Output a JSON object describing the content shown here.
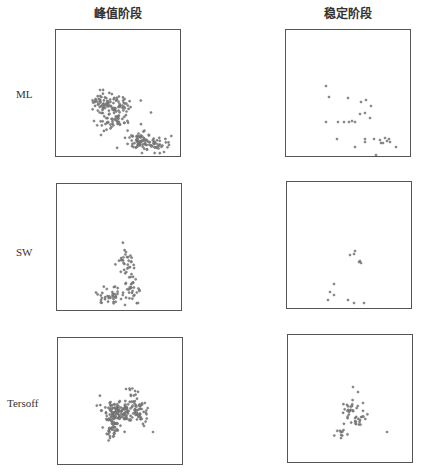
{
  "column_titles": [
    "峰值阶段",
    "稳定阶段"
  ],
  "row_labels": [
    "ML",
    "SW",
    "Tersoff"
  ],
  "colors": {
    "marker_fill": "#8a8a8a",
    "marker_stroke": "#5c5c5c",
    "frame": "#555555"
  },
  "chart_data": {
    "type": "scatter",
    "title": "",
    "layout": "3x2 grid of scatter panels, no axes/ticks, framed boxes",
    "columns": [
      "峰值阶段",
      "稳定阶段"
    ],
    "rows": [
      "ML",
      "SW",
      "Tersoff"
    ],
    "grid": false,
    "legend": "none",
    "panels": [
      {
        "row": "ML",
        "column": "峰值阶段",
        "box": [
          55,
          29,
          126,
          128
        ],
        "density": "dense",
        "clusters": [
          {
            "cx": 105,
            "cy": 103,
            "sx": 6,
            "sy": 5,
            "n": 55
          },
          {
            "cx": 119,
            "cy": 104,
            "sx": 5,
            "sy": 5,
            "n": 30
          },
          {
            "cx": 111,
            "cy": 120,
            "sx": 6,
            "sy": 5,
            "n": 40
          },
          {
            "cx": 138,
            "cy": 142,
            "sx": 6,
            "sy": 5,
            "n": 55
          },
          {
            "cx": 155,
            "cy": 144,
            "sx": 6,
            "sy": 4,
            "n": 40
          },
          {
            "cx": 126,
            "cy": 115,
            "sx": 9,
            "sy": 9,
            "n": 18
          }
        ],
        "extra_points": [
          [
            100,
            90
          ],
          [
            96,
            100
          ],
          [
            94,
            121
          ],
          [
            101,
            135
          ],
          [
            164,
            152
          ],
          [
            142,
            153
          ],
          [
            169,
            145
          ]
        ]
      },
      {
        "row": "ML",
        "column": "稳定阶段",
        "box": [
          285,
          29,
          126,
          128
        ],
        "density": "sparse",
        "points": [
          [
            326,
            86
          ],
          [
            329,
            97
          ],
          [
            348,
            98
          ],
          [
            361,
            102
          ],
          [
            366,
            100
          ],
          [
            371,
            106
          ],
          [
            360,
            114
          ],
          [
            365,
            113
          ],
          [
            370,
            118
          ],
          [
            326,
            122
          ],
          [
            338,
            122
          ],
          [
            344,
            122
          ],
          [
            349,
            122
          ],
          [
            352,
            121
          ],
          [
            355,
            122
          ],
          [
            337,
            139
          ],
          [
            365,
            139
          ],
          [
            365,
            142
          ],
          [
            374,
            139
          ],
          [
            380,
            140
          ],
          [
            381,
            143
          ],
          [
            385,
            138
          ],
          [
            389,
            139
          ],
          [
            390,
            142
          ],
          [
            387,
            141
          ],
          [
            383,
            143
          ],
          [
            355,
            147
          ],
          [
            376,
            155
          ],
          [
            396,
            147
          ]
        ]
      },
      {
        "row": "SW",
        "column": "峰值阶段",
        "box": [
          56,
          183,
          126,
          128
        ],
        "density": "medium",
        "clusters": [
          {
            "cx": 127,
            "cy": 263,
            "sx": 4,
            "sy": 6,
            "n": 30
          },
          {
            "cx": 133,
            "cy": 290,
            "sx": 4,
            "sy": 6,
            "n": 28
          },
          {
            "cx": 112,
            "cy": 294,
            "sx": 6,
            "sy": 4,
            "n": 30
          },
          {
            "cx": 102,
            "cy": 298,
            "sx": 3,
            "sy": 3,
            "n": 8
          }
        ],
        "extra_points": [
          [
            126,
            252
          ],
          [
            126,
            283
          ],
          [
            121,
            299
          ],
          [
            125,
            305
          ],
          [
            138,
            303
          ]
        ]
      },
      {
        "row": "SW",
        "column": "稳定阶段",
        "box": [
          286,
          181,
          126,
          128
        ],
        "density": "sparse",
        "points": [
          [
            350,
            255
          ],
          [
            354,
            254
          ],
          [
            355,
            251
          ],
          [
            360,
            261
          ],
          [
            361,
            263
          ],
          [
            359,
            262
          ],
          [
            334,
            284
          ],
          [
            330,
            292
          ],
          [
            334,
            295
          ],
          [
            328,
            300
          ],
          [
            348,
            300
          ],
          [
            354,
            303
          ],
          [
            364,
            303
          ]
        ]
      },
      {
        "row": "Tersoff",
        "column": "峰值阶段",
        "box": [
          57,
          337,
          126,
          128
        ],
        "density": "very dense",
        "clusters": [
          {
            "cx": 118,
            "cy": 411,
            "sx": 8,
            "sy": 6,
            "n": 120
          },
          {
            "cx": 140,
            "cy": 412,
            "sx": 5,
            "sy": 5,
            "n": 50
          },
          {
            "cx": 112,
            "cy": 427,
            "sx": 4,
            "sy": 6,
            "n": 45
          },
          {
            "cx": 133,
            "cy": 397,
            "sx": 3,
            "sy": 5,
            "n": 12
          }
        ],
        "extra_points": [
          [
            126,
            389
          ],
          [
            130,
            390
          ],
          [
            144,
            426
          ],
          [
            153,
            432
          ],
          [
            110,
            438
          ]
        ]
      },
      {
        "row": "Tersoff",
        "column": "稳定阶段",
        "box": [
          287,
          334,
          126,
          129
        ],
        "density": "sparse-medium",
        "clusters": [
          {
            "cx": 349,
            "cy": 409,
            "sx": 6,
            "sy": 4,
            "n": 22
          },
          {
            "cx": 358,
            "cy": 418,
            "sx": 5,
            "sy": 4,
            "n": 18
          },
          {
            "cx": 341,
            "cy": 431,
            "sx": 4,
            "sy": 4,
            "n": 10
          }
        ],
        "extra_points": [
          [
            353,
            387
          ],
          [
            358,
            392
          ],
          [
            363,
            403
          ],
          [
            387,
            432
          ],
          [
            341,
            438
          ]
        ]
      }
    ]
  }
}
